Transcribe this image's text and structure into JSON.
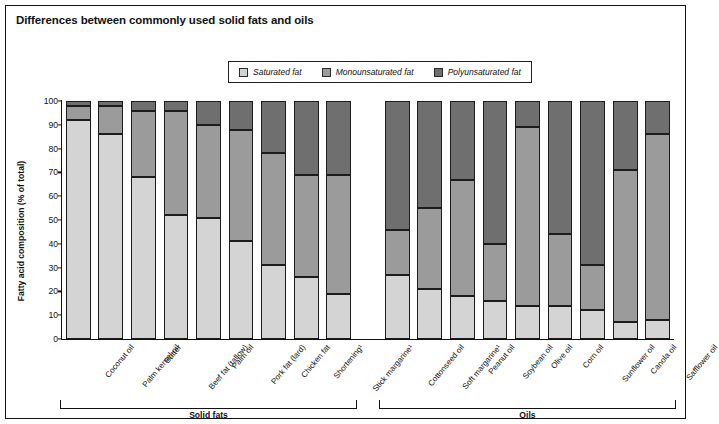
{
  "title": "Differences between commonly used solid fats and oils",
  "legend": {
    "items": [
      {
        "label": "Saturated fat",
        "key": "sat",
        "color": "#d4d4d4"
      },
      {
        "label": "Monounsaturated fat",
        "key": "mono",
        "color": "#9b9b9b"
      },
      {
        "label": "Polyunsaturated fat",
        "key": "poly",
        "color": "#6f6f6f"
      }
    ]
  },
  "axes": {
    "ylabel": "Fatty acid composition (% of total)",
    "yticks": [
      "0",
      "10",
      "20",
      "30",
      "40",
      "50",
      "60",
      "70",
      "80",
      "90",
      "100"
    ],
    "ylim": [
      0,
      100
    ]
  },
  "groups": [
    {
      "label": "Solid fats",
      "count": 10
    },
    {
      "label": "Oils",
      "count": 10
    }
  ],
  "chart_data": {
    "type": "bar",
    "title": "Differences between commonly used solid fats and oils",
    "xlabel": "",
    "ylabel": "Fatty acid composition (% of total)",
    "ylim": [
      0,
      100
    ],
    "stacked": true,
    "grid": false,
    "legend_position": "top-center",
    "categories": [
      "Coconut oil",
      "Palm kernel oil",
      "Butter",
      "Beef fat (tallow)",
      "Palm oil",
      "Pork fat (lard)",
      "Chicken fat",
      "Shortening¹",
      "Stick margarine¹",
      "Cottonseed oil",
      "Soft margarine¹",
      "Peanut oil",
      "Soybean oil",
      "Olive oil",
      "Corn oil",
      "Sunflower oil",
      "Canola oil",
      "Safflower oil"
    ],
    "series": [
      {
        "name": "Saturated fat",
        "values": [
          92,
          86,
          68,
          52,
          51,
          41,
          31,
          26,
          19,
          27,
          21,
          18,
          16,
          14,
          14,
          12,
          7,
          8
        ]
      },
      {
        "name": "Monounsaturated fat",
        "values": [
          6,
          12,
          28,
          44,
          39,
          47,
          47,
          43,
          50,
          19,
          34,
          49,
          24,
          75,
          30,
          19,
          64,
          78
        ]
      },
      {
        "name": "Polyunsaturated fat",
        "values": [
          2,
          2,
          4,
          4,
          10,
          12,
          22,
          31,
          31,
          54,
          45,
          33,
          60,
          11,
          56,
          69,
          29,
          14
        ]
      }
    ]
  },
  "bars": [
    {
      "name": "Coconut oil",
      "group": 0,
      "sat": 92,
      "mono": 6,
      "poly": 2
    },
    {
      "name": "Palm kernel oil",
      "group": 0,
      "sat": 86,
      "mono": 12,
      "poly": 2
    },
    {
      "name": "Butter",
      "group": 0,
      "sat": 68,
      "mono": 28,
      "poly": 4
    },
    {
      "name": "Beef fat (tallow)",
      "group": 0,
      "sat": 52,
      "mono": 44,
      "poly": 4
    },
    {
      "name": "Palm oil",
      "group": 0,
      "sat": 51,
      "mono": 39,
      "poly": 10
    },
    {
      "name": "Pork fat (lard)",
      "group": 0,
      "sat": 41,
      "mono": 47,
      "poly": 12
    },
    {
      "name": "Chicken fat",
      "group": 0,
      "sat": 31,
      "mono": 47,
      "poly": 22
    },
    {
      "name": "Shortening¹",
      "group": 0,
      "sat": 26,
      "mono": 43,
      "poly": 31
    },
    {
      "name": "Stick margarine¹",
      "group": 0,
      "sat": 19,
      "mono": 50,
      "poly": 31
    },
    {
      "name": "Cottonseed oil",
      "group": 1,
      "sat": 27,
      "mono": 19,
      "poly": 54
    },
    {
      "name": "Soft margarine¹",
      "group": 1,
      "sat": 21,
      "mono": 34,
      "poly": 45
    },
    {
      "name": "Peanut oil",
      "group": 1,
      "sat": 18,
      "mono": 49,
      "poly": 33
    },
    {
      "name": "Soybean oil",
      "group": 1,
      "sat": 16,
      "mono": 24,
      "poly": 60
    },
    {
      "name": "Olive oil",
      "group": 1,
      "sat": 14,
      "mono": 75,
      "poly": 11
    },
    {
      "name": "Corn oil",
      "group": 1,
      "sat": 14,
      "mono": 30,
      "poly": 56
    },
    {
      "name": "Sunflower oil",
      "group": 1,
      "sat": 12,
      "mono": 19,
      "poly": 69
    },
    {
      "name": "Canola oil",
      "group": 1,
      "sat": 7,
      "mono": 64,
      "poly": 29
    },
    {
      "name": "Safflower oil",
      "group": 1,
      "sat": 8,
      "mono": 78,
      "poly": 14
    }
  ]
}
